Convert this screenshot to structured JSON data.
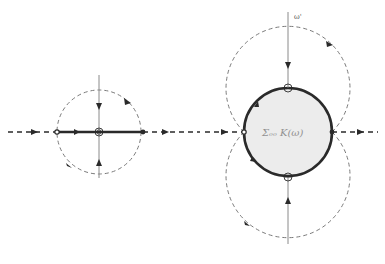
{
  "diagram": {
    "type": "complex-plane flow diagram (two panels)",
    "colors": {
      "background": "#ffffff",
      "stroke": "#2a2a2a",
      "dashed": "#7a7a7a",
      "fill_region": "#ececec",
      "thin_axis": "#8a8a8a"
    },
    "left_panel": {
      "center": [
        99,
        132
      ],
      "dashed_circle_radius": 42,
      "segment": {
        "x1": 57,
        "x2": 143
      },
      "vertical_axis": {
        "y1": 75,
        "y2": 178
      },
      "label": ""
    },
    "right_panel": {
      "center": [
        288,
        132
      ],
      "region_radius": 44,
      "top_point": [
        288,
        88
      ],
      "bottom_point": [
        288,
        177
      ],
      "vertical_axis": {
        "y1": 12,
        "y2": 244
      },
      "axis_label": "ω'",
      "region_label": "Σₒₒ K(ω)"
    },
    "horizontal_axis": {
      "y": 132,
      "x1": 8,
      "x2": 378
    }
  }
}
